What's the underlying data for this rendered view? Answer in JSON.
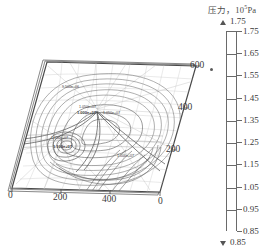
{
  "figure": {
    "type": "contour-plot-3d-perspective",
    "background_color": "#ffffff",
    "line_color": "#555555"
  },
  "colorbar": {
    "title_text": "压力，10",
    "title_exponent": "5",
    "title_unit": "Pa",
    "top_arrow_value": "1.75",
    "bottom_arrow_value": "0.85",
    "orientation": "vertical",
    "min": 0.85,
    "max": 1.75,
    "step": 0.1,
    "labels": [
      "1.75",
      "1.65",
      "1.55",
      "1.45",
      "1.35",
      "1.25",
      "1.15",
      "1.05",
      "0.95",
      "0.85"
    ],
    "segment_colors": [
      "#ffffff",
      "#ffffff",
      "#ffffff",
      "#ffffff",
      "#ffffff",
      "#ffffff",
      "#ffffff",
      "#ffffff",
      "#ffffff"
    ]
  },
  "axes": {
    "bottom_left_ticks": [
      "0",
      "200",
      "400"
    ],
    "bottom_right_tick": "0",
    "right_ticks": [
      "600",
      "400",
      "200"
    ]
  },
  "contour_labels": [
    {
      "id": "lbl-1",
      "text": "9.500e+06"
    },
    {
      "id": "lbl-2",
      "text": "1.050e+07"
    },
    {
      "id": "lbl-3",
      "text": "1.000e+07"
    },
    {
      "id": "lbl-4",
      "text": "1.050e+07"
    },
    {
      "id": "lbl-5",
      "text": "1.150e+07"
    },
    {
      "id": "lbl-6",
      "text": "1.100e+07"
    },
    {
      "id": "lbl-7",
      "text": "1.000e+07"
    }
  ],
  "chart_data": {
    "type": "heatmap",
    "xlabel": "",
    "ylabel": "",
    "grid": true,
    "legend_position": "right",
    "colorbar_range": [
      0.85,
      1.75
    ],
    "colorbar_ticks": [
      1.75,
      1.65,
      1.55,
      1.45,
      1.35,
      1.25,
      1.15,
      1.05,
      0.95,
      0.85
    ],
    "x_ticks": [
      0,
      200,
      400
    ],
    "y_ticks": [
      0,
      200,
      400,
      600
    ],
    "contour_levels": [
      9500000.0,
      10000000.0,
      10500000.0,
      11000000.0,
      11500000.0
    ],
    "annotations": [
      "9.500e+06",
      "1.050e+07",
      "1.000e+07",
      "1.150e+07",
      "1.100e+07"
    ]
  }
}
